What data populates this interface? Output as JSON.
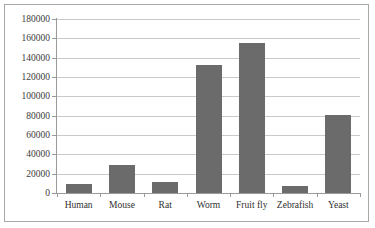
{
  "chart_data": {
    "type": "bar",
    "title": "",
    "subtitle": "",
    "xlabel": "",
    "ylabel": "",
    "categories": [
      "Human",
      "Mouse",
      "Rat",
      "Worm",
      "Fruit fly",
      "Zebrafish",
      "Yeast"
    ],
    "values": [
      9000,
      29000,
      11000,
      132000,
      155000,
      7000,
      81000
    ],
    "series": [
      {
        "name": "",
        "values": [
          9000,
          29000,
          11000,
          132000,
          155000,
          7000,
          81000
        ]
      }
    ],
    "ylim": [
      0,
      180000
    ],
    "y_tick_interval": 20000,
    "y_ticks": [
      180000,
      160000,
      140000,
      120000,
      100000,
      80000,
      60000,
      40000,
      20000,
      0
    ],
    "y_tick_labels": [
      "180000",
      "160000",
      "140000",
      "120000",
      "100000",
      "80000",
      "60000",
      "40000",
      "20000",
      "0"
    ],
    "grid": true,
    "grid_axis": "y",
    "legend": false,
    "legend_position": "none",
    "annotations": [],
    "colors": {
      "bar": "#6b6b6b",
      "gridline": "#c9c9c9",
      "axis": "#9a9a9a",
      "frame": "#a8a8a8",
      "background": "#ffffff",
      "tick_label": "#3b3b3b",
      "category_label": "#2f2f2f"
    }
  }
}
